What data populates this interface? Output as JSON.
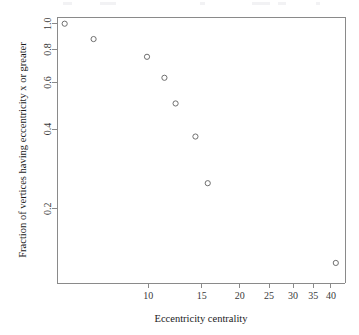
{
  "chart_data": {
    "type": "scatter",
    "title": "",
    "xlabel": "Eccentricity centrality",
    "ylabel": "Fraction of vertices having eccentricity x or greater",
    "xscale": "log",
    "yscale": "log",
    "grid": false,
    "legend": null,
    "xlim": [
      5.0,
      44.5
    ],
    "ylim": [
      0.105,
      1.06
    ],
    "xticks": [
      10,
      15,
      20,
      25,
      30,
      35,
      40
    ],
    "xticklabels": [
      "10",
      "15",
      "20",
      "25",
      "30",
      "35",
      "40"
    ],
    "yticks": [
      0.2,
      0.4,
      0.6,
      0.8,
      1.0
    ],
    "yticklabels": [
      "0.2",
      "0.4",
      "0.6",
      "0.8",
      "1.0"
    ],
    "marker": "open-circle",
    "marker_color": "#6f6f6f",
    "x": [
      5.3,
      6.6,
      9.9,
      11.3,
      12.3,
      14.3,
      15.7,
      41.5
    ],
    "y": [
      1.0,
      0.875,
      0.75,
      0.625,
      0.5,
      0.375,
      0.25,
      0.125
    ],
    "points": [
      {
        "x": 5.3,
        "y": 1.0
      },
      {
        "x": 6.6,
        "y": 0.875
      },
      {
        "x": 9.9,
        "y": 0.75
      },
      {
        "x": 11.3,
        "y": 0.625
      },
      {
        "x": 12.3,
        "y": 0.5
      },
      {
        "x": 14.3,
        "y": 0.375
      },
      {
        "x": 15.7,
        "y": 0.25
      },
      {
        "x": 41.5,
        "y": 0.125
      }
    ]
  }
}
